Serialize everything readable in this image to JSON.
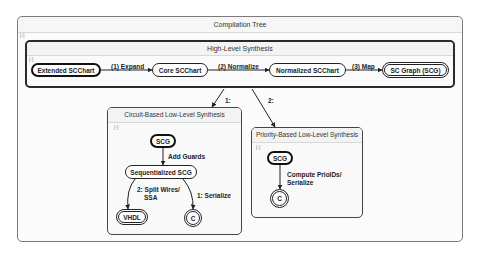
{
  "outer": {
    "title": "Compilation Tree",
    "collapse": "[-]"
  },
  "high_level": {
    "title": "High-Level Synthesis",
    "collapse": "[-]",
    "nodes": [
      "Extended SCChart",
      "Core SCChart",
      "Normalized SCChart",
      "SC Graph (SCG)"
    ],
    "edges": [
      "(1) Expand",
      "(2) Normalize",
      "(3) Map"
    ]
  },
  "branches": {
    "circuit": "1:",
    "priority": "2:"
  },
  "circuit": {
    "title": "Circuit-Based Low-Level Synthesis",
    "collapse": "[-]",
    "nodes": {
      "scg": "SCG",
      "seq": "Sequentialized SCG",
      "vhdl": "VHDL",
      "c": "C"
    },
    "edges": {
      "add_guards": "Add Guards",
      "split": "2: Split Wires/",
      "split2": "SSA",
      "serialize": "1: Serialize"
    }
  },
  "priority": {
    "title": "Priority-Based Low-Level Synthesis",
    "collapse": "[-]",
    "nodes": {
      "scg": "SCG",
      "c": "C"
    },
    "edges": {
      "compute": "Compute PrioIDs/",
      "compute2": "Serialize"
    }
  }
}
